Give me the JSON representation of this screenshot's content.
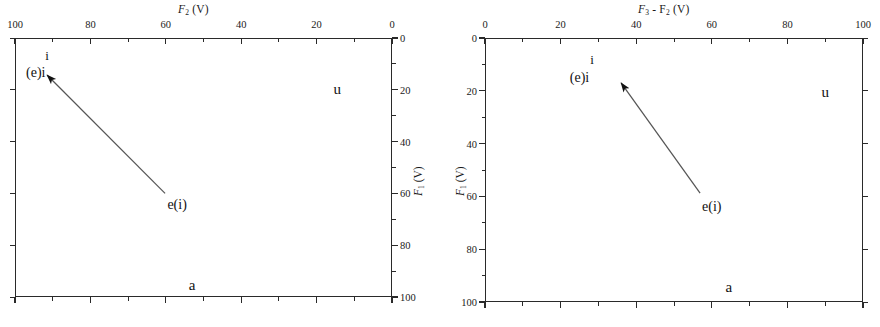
{
  "figure": {
    "background": "#ffffff",
    "ink_color": "#1a1a1a"
  },
  "chart_data": {
    "type": "scatter",
    "title": "",
    "panels": [
      {
        "id": "left",
        "xlabel": "F2 (V)",
        "xlabel_parts": {
          "symbol": "F",
          "sub": "2",
          "unit": "(V)"
        },
        "ylabel": "F1 (V)",
        "ylabel_parts": {
          "symbol": "F",
          "sub": "1",
          "unit": "(V)"
        },
        "xlim": [
          100,
          0
        ],
        "ylim": [
          0,
          100
        ],
        "x_axis_position": "top",
        "x_axis_reversed": true,
        "y_axis_position": "right",
        "y_axis_reversed": true,
        "xticks": [
          100,
          80,
          60,
          40,
          20,
          0
        ],
        "xtick_labels": [
          "100",
          "80",
          "60",
          "40",
          "20",
          "0"
        ],
        "yticks": [
          0,
          20,
          40,
          60,
          80,
          100
        ],
        "ytick_labels": [
          "0",
          "20",
          "40",
          "60",
          "80",
          "100"
        ],
        "minor_ticks_per_interval": 1,
        "grid": false,
        "legend": "none",
        "annotations": [
          {
            "name": "vowel-i-superscript",
            "text": "i",
            "x_frac": 0.085,
            "y_frac": 0.068
          },
          {
            "name": "vowel-ei",
            "text": "(e)i",
            "x_frac": 0.055,
            "y_frac": 0.135
          },
          {
            "name": "vowel-u",
            "text": "u",
            "x_frac": 0.855,
            "y_frac": 0.195
          },
          {
            "name": "vowel-ei-lower",
            "text": "e(i)",
            "x_frac": 0.43,
            "y_frac": 0.645
          },
          {
            "name": "vowel-a",
            "text": "a",
            "x_frac": 0.47,
            "y_frac": 0.955
          }
        ],
        "arrow": {
          "from_x_frac": 0.398,
          "from_y_frac": 0.6,
          "to_x_frac": 0.085,
          "to_y_frac": 0.143
        }
      },
      {
        "id": "right",
        "xlabel": "F3 - F2 (V)",
        "xlabel_parts": {
          "symbol1": "F",
          "sub1": "3",
          "op": "-",
          "symbol2": "F",
          "sub2": "2",
          "unit": "(V)"
        },
        "ylabel": "F1 (V)",
        "ylabel_parts": {
          "symbol": "F",
          "sub": "1",
          "unit": "(V)"
        },
        "xlim": [
          0,
          100
        ],
        "ylim": [
          0,
          100
        ],
        "x_axis_position": "top",
        "x_axis_reversed": false,
        "y_axis_position": "left",
        "y_axis_reversed": true,
        "xticks": [
          0,
          20,
          40,
          60,
          80,
          100
        ],
        "xtick_labels": [
          "0",
          "20",
          "40",
          "60",
          "80",
          "100"
        ],
        "yticks": [
          0,
          20,
          40,
          60,
          80,
          100
        ],
        "ytick_labels": [
          "0",
          "20",
          "40",
          "60",
          "80",
          "100"
        ],
        "minor_ticks_per_interval": 1,
        "grid": false,
        "legend": "none",
        "annotations": [
          {
            "name": "vowel-i-superscript",
            "text": "i",
            "x_frac": 0.283,
            "y_frac": 0.082
          },
          {
            "name": "vowel-ei",
            "text": "(e)i",
            "x_frac": 0.25,
            "y_frac": 0.15
          },
          {
            "name": "vowel-u",
            "text": "u",
            "x_frac": 0.9,
            "y_frac": 0.205
          },
          {
            "name": "vowel-ei-lower",
            "text": "e(i)",
            "x_frac": 0.6,
            "y_frac": 0.64
          },
          {
            "name": "vowel-a",
            "text": "a",
            "x_frac": 0.645,
            "y_frac": 0.945
          }
        ],
        "arrow": {
          "from_x_frac": 0.569,
          "from_y_frac": 0.588,
          "to_x_frac": 0.36,
          "to_y_frac": 0.17
        }
      }
    ]
  }
}
